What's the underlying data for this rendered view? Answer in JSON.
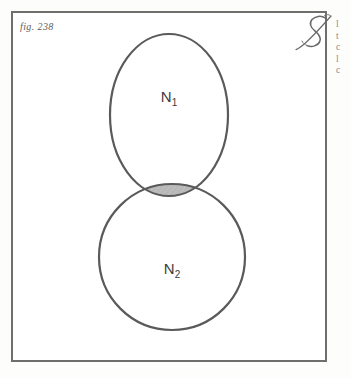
{
  "figure": {
    "label": "fig. 238",
    "universe_symbol": "S",
    "universe_symbol_name": "script-capital-s",
    "frame_color": "#6e6e6e",
    "background_color": "#ffffff"
  },
  "diagram": {
    "type": "venn",
    "sets": [
      {
        "id": "N1",
        "label": "N",
        "subscript": "1",
        "shape": "ellipse",
        "cx": 158,
        "cy": 104,
        "rx": 59,
        "ry": 81,
        "stroke": "#5a5a5a",
        "stroke_width": 2.2,
        "fill": "none",
        "label_x": 158,
        "label_y": 91
      },
      {
        "id": "N2",
        "label": "N",
        "subscript": "2",
        "shape": "circle",
        "cx": 161,
        "cy": 246,
        "r": 73,
        "stroke": "#5a5a5a",
        "stroke_width": 2.2,
        "fill": "none",
        "label_x": 161,
        "label_y": 263
      }
    ],
    "intersection": {
      "name": "N1-intersect-N2",
      "shaded": true,
      "fill_color": "#b9b9b9",
      "hatch": "diagonal",
      "hatch_color": "#a8a8a8",
      "stroke": "#5a5a5a"
    }
  },
  "margin_text": {
    "lines": [
      "l",
      "t",
      "c",
      "l",
      "c"
    ]
  }
}
